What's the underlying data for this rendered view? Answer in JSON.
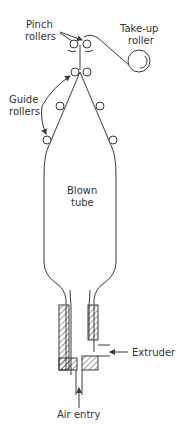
{
  "diagram": {
    "labels": {
      "pinch_rollers_line1": "Pinch",
      "pinch_rollers_line2": "rollers",
      "takeup_line1": "Take-up",
      "takeup_line2": "roller",
      "guide_line1": "Guide",
      "guide_line2": "rollers",
      "tube_line1": "Blown",
      "tube_line2": "tube",
      "extruder": "Extruder",
      "air_entry": "Air entry"
    },
    "components": [
      "pinch-rollers",
      "take-up-roller",
      "guide-rollers",
      "blown-tube",
      "die",
      "extruder-inlet",
      "air-inlet"
    ],
    "colors": {
      "line": "#3a3a3a",
      "text": "#333333",
      "background": "#ffffff"
    }
  }
}
